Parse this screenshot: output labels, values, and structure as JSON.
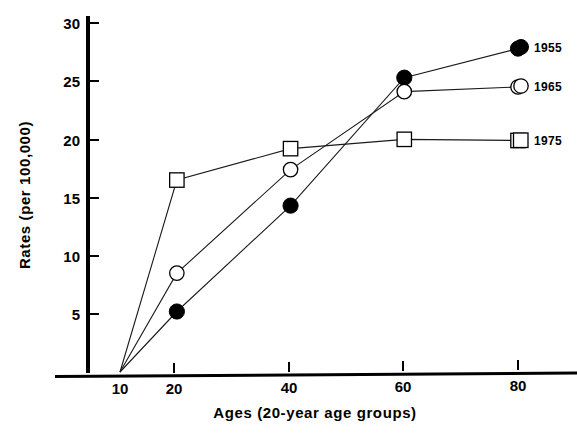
{
  "chart_data": {
    "type": "line",
    "title": "",
    "xlabel": "Ages (20-year age groups)",
    "ylabel": "Rates (per 100,000)",
    "x": [
      10,
      20,
      40,
      60,
      80
    ],
    "xticks": [
      10,
      20,
      40,
      60,
      80
    ],
    "xtick_labels": [
      "10",
      "20",
      "40",
      "60",
      "80"
    ],
    "yticks": [
      5,
      10,
      15,
      20,
      25,
      30
    ],
    "ytick_labels": [
      "5",
      "10",
      "15",
      "20",
      "25",
      "30"
    ],
    "xlim": [
      5,
      88
    ],
    "ylim": [
      0,
      31
    ],
    "grid": false,
    "legend_position": "right",
    "series": [
      {
        "name": "1955",
        "marker": "filled-circle",
        "values": [
          0,
          5.2,
          14.3,
          25.3,
          27.8
        ]
      },
      {
        "name": "1965",
        "marker": "open-circle",
        "values": [
          0,
          8.5,
          17.4,
          24.1,
          24.5
        ]
      },
      {
        "name": "1975",
        "marker": "open-square",
        "values": [
          0,
          16.5,
          19.2,
          20.0,
          19.9
        ]
      }
    ]
  },
  "axes": {
    "y_title": "Rates (per 100,000)",
    "x_title": "Ages (20-year age groups)",
    "x_tick_labels": [
      "10",
      "20",
      "40",
      "60",
      "80"
    ],
    "y_tick_labels": [
      "5",
      "10",
      "15",
      "20",
      "25",
      "30"
    ]
  },
  "legend": {
    "items": [
      {
        "label": "1955",
        "marker": "filled-circle"
      },
      {
        "label": "1965",
        "marker": "open-circle"
      },
      {
        "label": "1975",
        "marker": "open-square"
      }
    ]
  },
  "colors": {
    "ink": "#000000",
    "line": "#1a1a1a",
    "background": "#ffffff"
  }
}
